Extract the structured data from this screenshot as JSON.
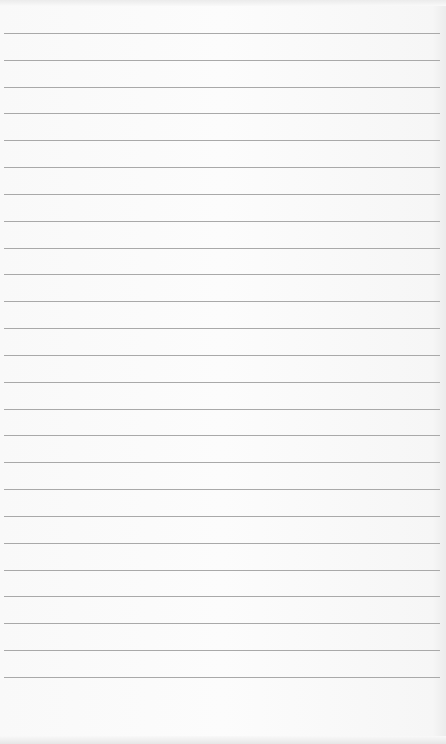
{
  "page": {
    "type": "lined-notepad-paper",
    "background_color": "#fbfbfb",
    "rule_color": "#a9a9a9",
    "rule_count": 25,
    "rule_start_y": 33,
    "rule_spacing": 26.83,
    "rule_left": 4,
    "rule_width": 436
  }
}
